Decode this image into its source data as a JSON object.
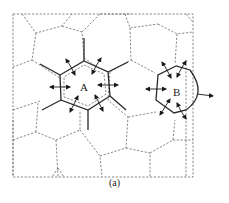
{
  "figure": {
    "caption": "(a)",
    "grain_labels": {
      "a": "A",
      "b": "B"
    }
  },
  "colors": {
    "background": "#ffffff",
    "dashed_boundary": "#6a6a6a",
    "solid_boundary": "#2a2a2a",
    "arrow": "#1a1a1a"
  }
}
